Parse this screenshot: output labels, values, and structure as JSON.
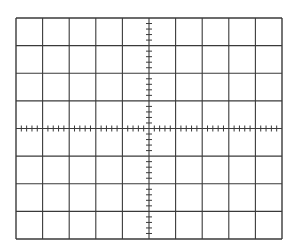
{
  "graticule": {
    "description": "Oscilloscope-style graticule grid",
    "origin_px": {
      "left": 16,
      "top": 18,
      "right": 282,
      "bottom": 239
    },
    "major_divisions": {
      "horizontal": 10,
      "vertical": 8
    },
    "minor_subdivisions_per_major": 5,
    "center_axis": {
      "x_px": 149,
      "y_px": 128.5
    },
    "line_color": "#3a3a3a",
    "tick_color": "#3a3a3a",
    "background": "#ffffff",
    "tick_length_px": 6
  }
}
